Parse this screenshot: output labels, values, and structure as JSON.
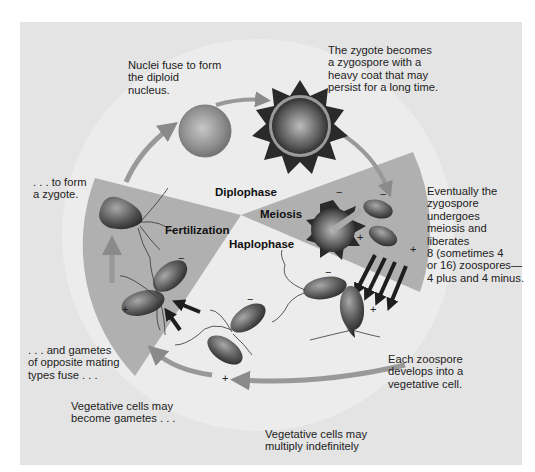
{
  "diagram": {
    "type": "life-cycle",
    "phases": {
      "diplophase": "Diplophase",
      "haplophase": "Haplophase",
      "meiosis": "Meiosis",
      "fertilization": "Fertilization"
    },
    "captions": {
      "nuclei_fuse": "Nuclei fuse to form\nthe diploid\nnucleus.",
      "zygospore": "The zygote becomes\na zygospore with a\nheavy coat that may\npersist for a long time.",
      "meiosis_release": "Eventually the\nzygospore\nundergoes\nmeiosis and\nliberates\n8 (sometimes 4\nor 16) zoospores—\n4 plus and 4 minus.",
      "each_zoospore": "Each zoospore\ndevelops into a\nvegetative cell.",
      "multiply": "Vegetative cells may\nmultiply indefinitely",
      "become_gametes": "Vegetative cells may\nbecome gametes . . .",
      "gametes_fuse": ". . . and gametes\nof opposite mating\ntypes fuse . . .",
      "form_zygote": ". . . to form\na zygote."
    },
    "mating_signs": {
      "plus": "+",
      "minus": "−"
    },
    "colors": {
      "background": "#ffffff",
      "panel": "#e4e4e4",
      "light_circle": "#ececec",
      "wedge": "#b0b0b0",
      "cell_dark": "#555555",
      "arrow": "#999999",
      "arrow_dark": "#222222"
    }
  }
}
